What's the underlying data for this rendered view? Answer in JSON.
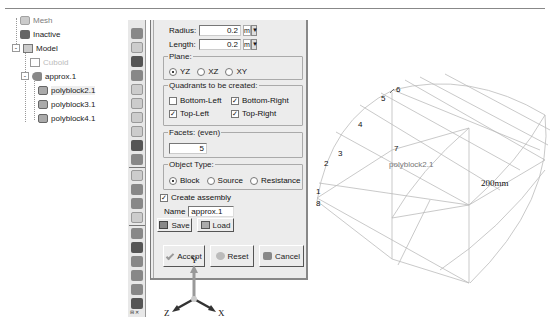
{
  "tree": {
    "items": [
      {
        "label": "Mesh",
        "icon": "mesh-icon",
        "partial": true
      },
      {
        "label": "Inactive",
        "icon": "inactive-icon"
      },
      {
        "label": "Model",
        "icon": "model-icon",
        "expander": "-"
      },
      {
        "label": "Cuboid",
        "icon": "cube-icon",
        "dimmed": true
      },
      {
        "label": "approx.1",
        "icon": "assembly-icon",
        "expander": "-"
      },
      {
        "label": "polyblock2.1",
        "icon": "block-icon",
        "selected": true
      },
      {
        "label": "polyblock3.1",
        "icon": "block-icon"
      },
      {
        "label": "polyblock4.1",
        "icon": "block-icon"
      }
    ]
  },
  "dialog": {
    "radius": {
      "label": "Radius:",
      "value": "0.2",
      "unit": "m"
    },
    "length": {
      "label": "Length:",
      "value": "0.2",
      "unit": "m"
    },
    "plane": {
      "legend": "Plane:",
      "options": [
        "YZ",
        "XZ",
        "XY"
      ],
      "selected": "YZ"
    },
    "quadrants": {
      "legend": "Quadrants to be created:",
      "bottom_left": {
        "label": "Bottom-Left",
        "checked": false
      },
      "bottom_right": {
        "label": "Bottom-Right",
        "checked": true
      },
      "top_left": {
        "label": "Top-Left",
        "checked": true
      },
      "top_right": {
        "label": "Top-Right",
        "checked": true
      }
    },
    "facets": {
      "legend": "Facets: (even)",
      "value": "5"
    },
    "object_type": {
      "legend": "Object Type:",
      "options": [
        "Block",
        "Source",
        "Resistance"
      ],
      "selected": "Block"
    },
    "create_assembly": {
      "label": "Create assembly",
      "checked": true
    },
    "name": {
      "label": "Name",
      "value": "approx.1"
    },
    "save_label": "Save",
    "load_label": "Load",
    "accept_label": "Accept",
    "reset_label": "Reset",
    "cancel_label": "Cancel",
    "check_mark": "✓"
  },
  "triad": {
    "x": "X",
    "y": "Y",
    "z": "Z"
  },
  "viewport": {
    "object_label": "polyblock2.1",
    "dimension_label": "200mm",
    "vertex_labels": [
      "1",
      "2",
      "3",
      "4",
      "5",
      "6",
      "7",
      "8"
    ]
  },
  "toolbar": {
    "bottom_text": "⊟ ✕"
  }
}
